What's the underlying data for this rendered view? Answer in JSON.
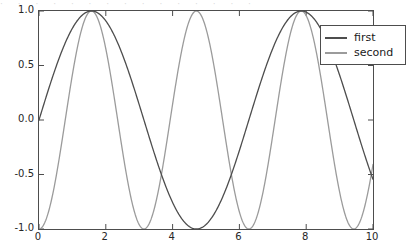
{
  "figure": {
    "background_color": "#ffffff",
    "top_artifact_text": "· · · · · · · · · · · · · · ·"
  },
  "chart_data": {
    "type": "line",
    "title": "",
    "xlabel": "",
    "ylabel": "",
    "xlim": [
      0,
      10
    ],
    "ylim": [
      -1.0,
      1.0
    ],
    "grid": false,
    "legend_position": "upper right",
    "xticks": [
      0,
      2,
      4,
      6,
      8,
      10
    ],
    "xtick_labels": [
      "0",
      "2",
      "4",
      "6",
      "8",
      "10"
    ],
    "yticks": [
      -1.0,
      -0.5,
      0.0,
      0.5,
      1.0
    ],
    "ytick_labels": [
      "-1.0",
      "-0.5",
      "0.0",
      "0.5",
      "1.0"
    ],
    "series": [
      {
        "name": "first",
        "color": "#4d4d4d",
        "linewidth": 1.3,
        "formula": "sin(x)",
        "amplitude": 1.0,
        "angular_frequency": 1.0,
        "phase": 0.0,
        "x": [
          0.0,
          0.25,
          0.5,
          0.75,
          1.0,
          1.25,
          1.5,
          1.57,
          1.75,
          2.0,
          2.25,
          2.5,
          2.75,
          3.0,
          3.14,
          3.25,
          3.5,
          3.75,
          4.0,
          4.25,
          4.5,
          4.71,
          5.0,
          5.25,
          5.5,
          5.75,
          6.0,
          6.28,
          6.5,
          6.75,
          7.0,
          7.25,
          7.5,
          7.75,
          7.85,
          8.0,
          8.25,
          8.5,
          8.75,
          9.0,
          9.25,
          9.42,
          9.75,
          10.0
        ],
        "y": [
          0.0,
          0.247,
          0.479,
          0.682,
          0.841,
          0.949,
          0.997,
          1.0,
          0.984,
          0.909,
          0.778,
          0.599,
          0.382,
          0.141,
          0.0,
          -0.108,
          -0.351,
          -0.572,
          -0.757,
          -0.895,
          -0.978,
          -1.0,
          -0.959,
          -0.861,
          -0.706,
          -0.501,
          -0.279,
          0.0,
          0.215,
          0.443,
          0.657,
          0.834,
          0.938,
          0.994,
          1.0,
          0.989,
          0.913,
          0.798,
          0.625,
          0.412,
          0.172,
          0.0,
          -0.325,
          -0.544
        ]
      },
      {
        "name": "second",
        "color": "#9b9b9b",
        "linewidth": 1.3,
        "formula": "-cos(2x)",
        "amplitude": 1.0,
        "angular_frequency": 2.0,
        "phase": 0.0,
        "x": [
          0.0,
          0.25,
          0.5,
          0.75,
          1.0,
          1.25,
          1.5,
          1.57,
          1.75,
          2.0,
          2.25,
          2.5,
          2.75,
          3.0,
          3.14,
          3.25,
          3.5,
          3.75,
          4.0,
          4.25,
          4.5,
          4.71,
          5.0,
          5.25,
          5.5,
          5.75,
          6.0,
          6.28,
          6.5,
          6.75,
          7.0,
          7.25,
          7.5,
          7.75,
          7.85,
          8.0,
          8.25,
          8.5,
          8.75,
          9.0,
          9.25,
          9.42,
          9.75,
          10.0
        ],
        "y": [
          -1.0,
          -0.878,
          -0.54,
          -0.071,
          0.416,
          0.801,
          0.99,
          1.0,
          0.942,
          0.654,
          0.211,
          -0.284,
          -0.708,
          -0.96,
          -1.0,
          -0.99,
          -0.839,
          -0.472,
          0.009,
          0.478,
          0.825,
          1.0,
          0.839,
          0.472,
          -0.009,
          -0.478,
          -0.825,
          -1.0,
          -0.957,
          -0.724,
          -0.315,
          0.174,
          0.627,
          0.927,
          1.0,
          0.98,
          0.777,
          0.396,
          -0.095,
          -0.561,
          -0.878,
          -1.0,
          -0.752,
          -0.408
        ]
      }
    ]
  },
  "legend": {
    "entries": [
      {
        "label": "first"
      },
      {
        "label": "second"
      }
    ]
  }
}
